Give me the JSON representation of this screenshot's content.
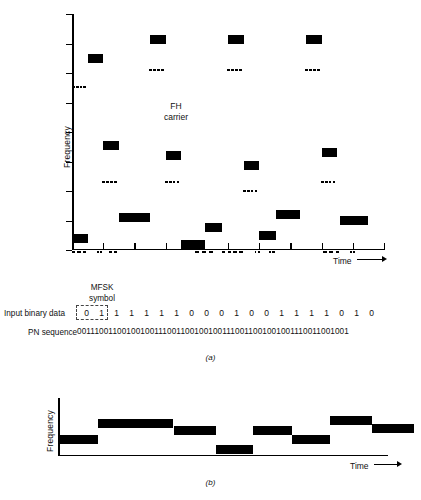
{
  "chart_data": [
    {
      "type": "bar",
      "id": "a",
      "title": "",
      "xlabel": "Time",
      "ylabel": "Frequency",
      "caption": "(a)",
      "annotation": "FH\ncarrier",
      "annotation_lines": [
        "FH",
        "carrier"
      ],
      "grid": false,
      "legend": "none",
      "xlim": [
        0,
        20
      ],
      "ylim": [
        0,
        8
      ],
      "y_ticks": [
        0,
        1,
        2,
        3,
        4,
        5,
        6,
        7,
        8
      ],
      "x_ticks": [
        0,
        2,
        4,
        6,
        8,
        10,
        12,
        14,
        16,
        18,
        20
      ],
      "description": "MFSK symbol tones hopping in frequency over time; dashed marks show the FH carrier below each tone burst.",
      "bars": [
        {
          "x0": 0.0,
          "x1": 1.0,
          "level": 0.25,
          "tone": true
        },
        {
          "x0": 1.0,
          "x1": 2.0,
          "level": 6.35,
          "tone": true
        },
        {
          "x0": 2.0,
          "x1": 3.0,
          "level": 3.4,
          "tone": true
        },
        {
          "x0": 3.0,
          "x1": 5.0,
          "level": 0.95,
          "tone": true
        },
        {
          "x0": 5.0,
          "x1": 6.0,
          "level": 7.0,
          "tone": true
        },
        {
          "x0": 6.0,
          "x1": 7.0,
          "level": 3.05,
          "tone": true
        },
        {
          "x0": 7.0,
          "x1": 8.5,
          "level": 0.05,
          "tone": true
        },
        {
          "x0": 8.5,
          "x1": 9.6,
          "level": 0.6,
          "tone": true
        },
        {
          "x0": 10.0,
          "x1": 11.0,
          "level": 7.0,
          "tone": true
        },
        {
          "x0": 11.0,
          "x1": 12.0,
          "level": 2.7,
          "tone": true
        },
        {
          "x0": 12.0,
          "x1": 13.1,
          "level": 0.35,
          "tone": true
        },
        {
          "x0": 13.1,
          "x1": 14.6,
          "level": 1.05,
          "tone": true
        },
        {
          "x0": 15.0,
          "x1": 16.0,
          "level": 7.0,
          "tone": true
        },
        {
          "x0": 16.0,
          "x1": 17.0,
          "level": 3.15,
          "tone": true
        },
        {
          "x0": 17.2,
          "x1": 19.0,
          "level": 0.85,
          "tone": true
        }
      ],
      "carrier_marks": [
        {
          "x0": 0.05,
          "x1": 0.95,
          "level": 5.55
        },
        {
          "x0": 4.95,
          "x1": 5.95,
          "level": 6.15
        },
        {
          "x0": 9.95,
          "x1": 10.95,
          "level": 6.15
        },
        {
          "x0": 14.95,
          "x1": 15.95,
          "level": 6.15
        },
        {
          "x0": 1.95,
          "x1": 2.95,
          "level": 2.35
        },
        {
          "x0": 5.95,
          "x1": 6.95,
          "level": 2.35
        },
        {
          "x0": 10.95,
          "x1": 11.95,
          "level": 2.05
        },
        {
          "x0": 15.95,
          "x1": 16.95,
          "level": 2.35
        }
      ],
      "baseline_dashes": [
        {
          "x0": 0.0,
          "x1": 1.05
        },
        {
          "x0": 1.6,
          "x1": 2.0
        },
        {
          "x0": 2.35,
          "x1": 3.0
        },
        {
          "x0": 7.9,
          "x1": 9.2
        },
        {
          "x0": 9.6,
          "x1": 11.1
        },
        {
          "x0": 11.7,
          "x1": 12.1
        },
        {
          "x0": 12.6,
          "x1": 13.1
        },
        {
          "x0": 16.1,
          "x1": 17.3
        },
        {
          "x0": 17.8,
          "x1": 18.2
        }
      ]
    },
    {
      "type": "bar",
      "id": "b",
      "title": "",
      "xlabel": "Time",
      "ylabel": "Frequency",
      "caption": "(b)",
      "grid": false,
      "legend": "none",
      "xlim": [
        0,
        20
      ],
      "ylim": [
        0,
        5
      ],
      "description": "Dehopped MFSK tone pattern after frequency de-hopping.",
      "bars": [
        {
          "x0": 0.0,
          "x1": 2.4,
          "level": 1.05
        },
        {
          "x0": 2.4,
          "x1": 7.0,
          "level": 2.45
        },
        {
          "x0": 7.0,
          "x1": 9.6,
          "level": 1.8
        },
        {
          "x0": 9.6,
          "x1": 11.8,
          "level": 0.18
        },
        {
          "x0": 11.8,
          "x1": 14.2,
          "level": 1.85
        },
        {
          "x0": 14.2,
          "x1": 16.5,
          "level": 1.05
        },
        {
          "x0": 16.5,
          "x1": 19.0,
          "level": 2.65
        },
        {
          "x0": 19.0,
          "x1": 21.6,
          "level": 1.95
        }
      ]
    }
  ],
  "labels": {
    "mfsk_symbol_line1": "MFSK",
    "mfsk_symbol_line2": "symbol",
    "input_binary_data": "Input binary data",
    "pn_sequence": "PN sequence",
    "fh_carrier_line1": "FH",
    "fh_carrier_line2": "carrier",
    "frequency_axis": "Frequency",
    "time_axis": "Time",
    "caption_a": "(a)",
    "caption_b": "(b)"
  },
  "sequences": {
    "binary_bits": [
      "0",
      "1",
      "1",
      "1",
      "1",
      "1",
      "1",
      "0",
      "0",
      "0",
      "1",
      "0",
      "0",
      "1",
      "1",
      "1",
      "1",
      "0",
      "1",
      "0"
    ],
    "pn_sequence": "001110011001001001110011001001001110011001001001110011001001"
  },
  "colors": {
    "ink": "#000000",
    "background": "#ffffff"
  }
}
